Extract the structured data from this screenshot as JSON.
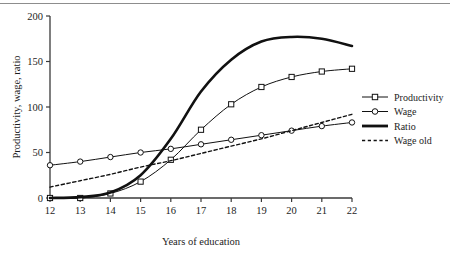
{
  "figure": {
    "background_color": "#ffffff",
    "axis_color": "#3a3a3a",
    "line_color": "#111111",
    "rule_color": "#8d8d8d"
  },
  "chart_data": {
    "type": "line",
    "title": "",
    "xlabel": "Years of education",
    "ylabel": "Productivity, wage, ratio",
    "xlim": [
      12,
      22
    ],
    "ylim": [
      0,
      200
    ],
    "xticks": [
      12,
      13,
      14,
      15,
      16,
      17,
      18,
      19,
      20,
      21,
      22
    ],
    "yticks": [
      0,
      50,
      100,
      150,
      200
    ],
    "xtick_labels": [
      "12",
      "13",
      "14",
      "15",
      "16",
      "17",
      "18",
      "19",
      "20",
      "21",
      "22"
    ],
    "ytick_labels": [
      "0",
      "50",
      "100",
      "150",
      "200"
    ],
    "grid": false,
    "legend_position": "right",
    "x": [
      12,
      13,
      14,
      15,
      16,
      17,
      18,
      19,
      20,
      21,
      22
    ],
    "series": [
      {
        "name": "Productivity",
        "marker": "square",
        "linestyle": "solid",
        "linewidth": 1,
        "values": [
          0,
          0,
          5,
          18,
          42,
          75,
          103,
          122,
          133,
          139,
          142
        ]
      },
      {
        "name": "Wage",
        "marker": "circle",
        "linestyle": "solid",
        "linewidth": 1,
        "values": [
          36,
          40,
          45,
          50,
          54,
          59,
          64,
          69,
          74,
          79,
          83
        ]
      },
      {
        "name": "Ratio",
        "marker": "none",
        "linestyle": "solid",
        "linewidth": 2.6,
        "values": [
          0,
          1,
          6,
          25,
          65,
          117,
          152,
          172,
          177,
          175,
          167
        ]
      },
      {
        "name": "Wage old",
        "marker": "none",
        "linestyle": "dashed",
        "linewidth": 1.4,
        "values": [
          12,
          19,
          26,
          34,
          41,
          49,
          57,
          65,
          74,
          83,
          92
        ]
      }
    ]
  },
  "legend": {
    "entries": [
      {
        "label": "Productivity",
        "marker": "square",
        "linestyle": "solid"
      },
      {
        "label": "Wage",
        "marker": "circle",
        "linestyle": "solid"
      },
      {
        "label": "Ratio",
        "marker": "none",
        "linestyle": "solid-thick"
      },
      {
        "label": "Wage old",
        "marker": "none",
        "linestyle": "dashed"
      }
    ]
  }
}
